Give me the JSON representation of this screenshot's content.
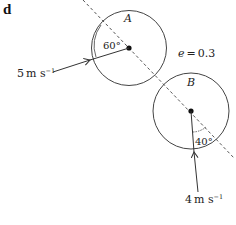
{
  "part_label": "d",
  "balls": [
    {
      "name": "A",
      "angle_label": "60°",
      "speed_label": "5 m s⁻¹",
      "speed_num": "5",
      "speed_unit": "m s",
      "speed_exp": "−1"
    },
    {
      "name": "B",
      "angle_label": "40°",
      "speed_label": "4 m s⁻¹",
      "speed_num": "4",
      "speed_unit": "m s",
      "speed_exp": "−1"
    }
  ],
  "restitution": {
    "symbol": "e",
    "equals": "=",
    "value": "0.3",
    "label": "e = 0.3"
  },
  "colors": {
    "stroke": "#333333",
    "background": "#ffffff"
  }
}
